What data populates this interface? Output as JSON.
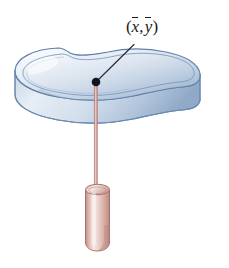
{
  "figure": {
    "background_color": "#ffffff",
    "width": 229,
    "height": 268
  },
  "label": {
    "text": "(x, y)",
    "open_paren": "(",
    "x_symbol": "x",
    "comma": ",",
    "y_symbol": "y",
    "close_paren": ")",
    "meaning": "centroid coordinates x-bar y-bar",
    "color": "#1a1a1a",
    "position": {
      "x": 142,
      "y": 32
    }
  },
  "leader_line": {
    "from": {
      "x": 133,
      "y": 45
    },
    "to": {
      "x": 98,
      "y": 80
    },
    "color": "#2b2b33",
    "width": 1.1
  },
  "centroid_dot": {
    "center": {
      "x": 96,
      "y": 82
    },
    "radius": 4.2,
    "color": "#14141c"
  },
  "lamina": {
    "description": "kidney-bean shaped flat slab seen in perspective",
    "top_face_color_light": "#f2f6fa",
    "top_face_color_mid": "#ccd9e8",
    "top_face_color_dark": "#9fb4cf",
    "side_face_color_light": "#dbe4f0",
    "side_face_color_dark": "#8fa6c4",
    "outline_color": "#5f7fa8",
    "inner_rim_color": "#7d99bb",
    "thickness_px": 26,
    "bounds": {
      "left": 14,
      "top": 46,
      "right": 201,
      "bottom": 137
    }
  },
  "plumb_string": {
    "from": {
      "x": 96,
      "y": 82
    },
    "to": {
      "x": 96,
      "y": 190
    },
    "color": "#d9a79c",
    "edge_color": "#b8766b",
    "width": 3
  },
  "plumb_bob": {
    "description": "salmon colored rounded cylinder weight",
    "bounds": {
      "left": 84,
      "top": 182,
      "right": 111,
      "bottom": 251
    },
    "fill_light": "#f3e0dc",
    "fill_mid": "#e0b9b1",
    "fill_dark": "#c08d84",
    "outline_color": "#a8736a"
  }
}
